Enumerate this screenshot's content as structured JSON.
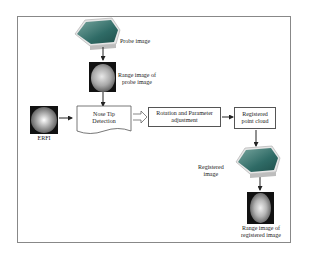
{
  "diagram": {
    "nodes": {
      "probe_image": {
        "label": "Probe image"
      },
      "range_probe": {
        "label_line1": "Range image of",
        "label_line2": "probe image"
      },
      "erfi": {
        "label": "ERFI"
      },
      "nose_tip": {
        "line1": "Nose Tip",
        "line2": "Detection"
      },
      "rotation": {
        "line1": "Rotation and Parameter",
        "line2": "adjustment"
      },
      "registered_cloud": {
        "line1": "Registered",
        "line2": "point cloud"
      },
      "registered_image": {
        "line1": "Registered",
        "line2": "image"
      },
      "range_registered": {
        "line1": "Range image of",
        "line2": "registered image"
      }
    },
    "edges": [
      {
        "from": "probe_image",
        "to": "range_probe"
      },
      {
        "from": "range_probe",
        "to": "nose_tip"
      },
      {
        "from": "erfi",
        "to": "nose_tip"
      },
      {
        "from": "nose_tip",
        "to": "rotation",
        "style": "double-outline"
      },
      {
        "from": "rotation",
        "to": "registered_cloud"
      },
      {
        "from": "registered_cloud",
        "to": "registered_image"
      },
      {
        "from": "registered_image",
        "to": "range_registered"
      }
    ],
    "colors": {
      "frame": "#888888",
      "line": "#222222",
      "face_teal": "#3f7f7a",
      "base": "#e8e8e8"
    }
  }
}
